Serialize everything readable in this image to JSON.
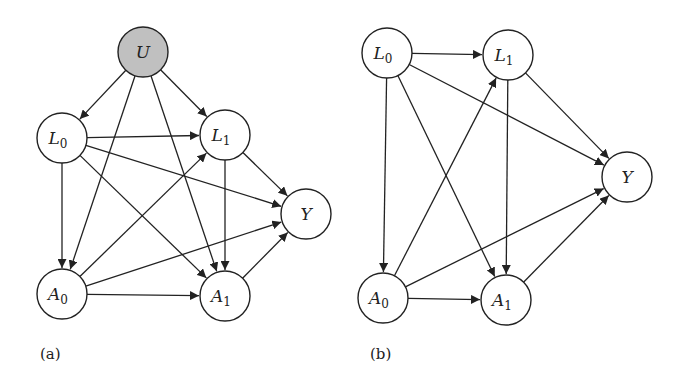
{
  "colors": {
    "stroke": "#222222",
    "node_fill": "#ffffff",
    "latent_fill": "#c0c0c0",
    "background": "#ffffff"
  },
  "node_radius": 25,
  "panels": [
    {
      "id": "a",
      "label": "(a)",
      "label_pos": [
        40,
        345
      ],
      "nodes": [
        {
          "id": "U",
          "text": "U",
          "sub": "",
          "x": 143,
          "y": 52,
          "latent": true
        },
        {
          "id": "L0",
          "text": "L",
          "sub": "0",
          "x": 62,
          "y": 138,
          "latent": false
        },
        {
          "id": "L1",
          "text": "L",
          "sub": "1",
          "x": 225,
          "y": 135,
          "latent": false
        },
        {
          "id": "Y",
          "text": "Y",
          "sub": "",
          "x": 306,
          "y": 214,
          "latent": false
        },
        {
          "id": "A0",
          "text": "A",
          "sub": "0",
          "x": 62,
          "y": 294,
          "latent": false
        },
        {
          "id": "A1",
          "text": "A",
          "sub": "1",
          "x": 225,
          "y": 296,
          "latent": false
        }
      ],
      "edges": [
        [
          "U",
          "L0"
        ],
        [
          "U",
          "L1"
        ],
        [
          "U",
          "A0"
        ],
        [
          "U",
          "A1"
        ],
        [
          "L0",
          "L1"
        ],
        [
          "L0",
          "Y"
        ],
        [
          "L0",
          "A0"
        ],
        [
          "L0",
          "A1"
        ],
        [
          "L1",
          "Y"
        ],
        [
          "L1",
          "A1"
        ],
        [
          "A0",
          "L1"
        ],
        [
          "A0",
          "Y"
        ],
        [
          "A0",
          "A1"
        ],
        [
          "A1",
          "Y"
        ]
      ]
    },
    {
      "id": "b",
      "label": "(b)",
      "label_pos": [
        370,
        345
      ],
      "nodes": [
        {
          "id": "L0",
          "text": "L",
          "sub": "0",
          "x": 387,
          "y": 53,
          "latent": false
        },
        {
          "id": "L1",
          "text": "L",
          "sub": "1",
          "x": 508,
          "y": 55,
          "latent": false
        },
        {
          "id": "Y",
          "text": "Y",
          "sub": "",
          "x": 627,
          "y": 177,
          "latent": false
        },
        {
          "id": "A0",
          "text": "A",
          "sub": "0",
          "x": 383,
          "y": 298,
          "latent": false
        },
        {
          "id": "A1",
          "text": "A",
          "sub": "1",
          "x": 506,
          "y": 300,
          "latent": false
        }
      ],
      "edges": [
        [
          "L0",
          "L1"
        ],
        [
          "L0",
          "Y"
        ],
        [
          "L0",
          "A0"
        ],
        [
          "L0",
          "A1"
        ],
        [
          "L1",
          "Y"
        ],
        [
          "L1",
          "A1"
        ],
        [
          "A0",
          "L1"
        ],
        [
          "A0",
          "Y"
        ],
        [
          "A0",
          "A1"
        ],
        [
          "A1",
          "Y"
        ]
      ]
    }
  ]
}
